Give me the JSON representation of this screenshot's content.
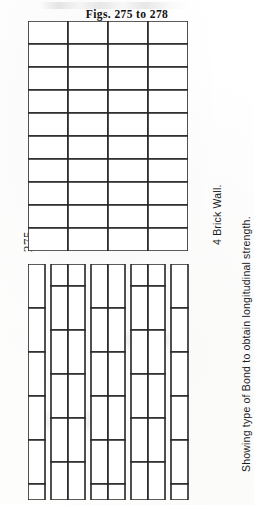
{
  "page": {
    "background_color": "#ffffff",
    "ink_color": "#262626"
  },
  "header": {
    "figs_caption": "Figs. 275 to 278",
    "partial_running_head": ""
  },
  "left_label": {
    "fig_number": "275"
  },
  "right_labels": {
    "wall_title": "4 Brick Wall.",
    "wall_subtitle": "Showing type of Bond to obtain longitudinal strength."
  },
  "diagrams": {
    "top": {
      "name": "stretcher-grid-plan",
      "columns": 4,
      "rows": 10,
      "cell_width": 40,
      "cell_height": 23,
      "width": 160,
      "height": 230
    },
    "bottom": {
      "name": "longitudinal-bond-plan",
      "columns": 4,
      "column_pitch": 40,
      "half_brick_width": 17,
      "brick_height": 44,
      "stagger": 22,
      "width": 162,
      "height": 236
    }
  }
}
